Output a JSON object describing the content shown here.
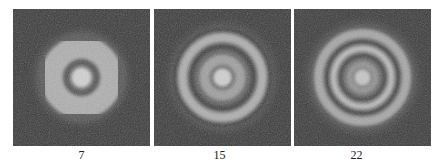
{
  "figure": {
    "panels": [
      {
        "label": "7",
        "description": "noisy disc pattern with bright center spot and one faint dark ring",
        "rings": [
          {
            "r": 0,
            "w": 10,
            "color": "#d8d8d8",
            "op": 0.95
          },
          {
            "r": 16,
            "w": 7,
            "color": "#4a4a4a",
            "op": 0.7
          },
          {
            "r": 30,
            "w": 22,
            "color": "#bdbdbd",
            "op": 0.85
          }
        ],
        "halo_radius": 46
      },
      {
        "label": "15",
        "description": "bright center spot surrounded by two dark rings and bright annuli",
        "rings": [
          {
            "r": 0,
            "w": 9,
            "color": "#d6d6d6",
            "op": 0.95
          },
          {
            "r": 18,
            "w": 10,
            "color": "#a8a8a8",
            "op": 0.85
          },
          {
            "r": 31,
            "w": 5,
            "color": "#3a3a3a",
            "op": 0.9
          },
          {
            "r": 40,
            "w": 9,
            "color": "#b8b8b8",
            "op": 0.9
          },
          {
            "r": 48,
            "w": 4,
            "color": "#3a3a3a",
            "op": 0.8
          }
        ],
        "halo_radius": 54
      },
      {
        "label": "22",
        "description": "center spot with multiple concentric bright and dark rings",
        "rings": [
          {
            "r": 0,
            "w": 8,
            "color": "#cfcfcf",
            "op": 0.9
          },
          {
            "r": 13,
            "w": 6,
            "color": "#9a9a9a",
            "op": 0.8
          },
          {
            "r": 22,
            "w": 4,
            "color": "#3c3c3c",
            "op": 0.85
          },
          {
            "r": 29,
            "w": 6,
            "color": "#c4c4c4",
            "op": 0.9
          },
          {
            "r": 36,
            "w": 4,
            "color": "#3c3c3c",
            "op": 0.85
          },
          {
            "r": 44,
            "w": 9,
            "color": "#b4b4b4",
            "op": 0.85
          }
        ],
        "halo_radius": 56
      }
    ]
  }
}
